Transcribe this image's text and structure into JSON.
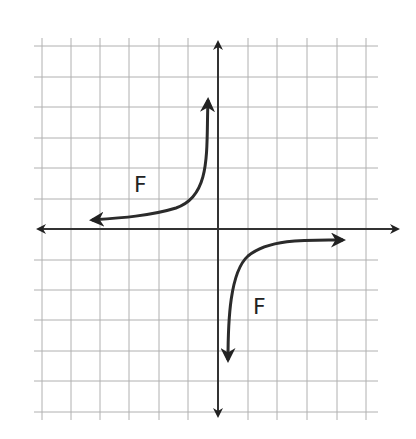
{
  "diagram": {
    "type": "coordinate-grid-graph",
    "grid": {
      "x_lines_px": [
        42,
        71,
        100,
        129,
        159,
        188,
        218,
        248,
        277,
        307,
        337,
        366
      ],
      "y_lines_px": [
        46,
        77,
        107,
        138,
        168,
        199,
        229,
        260,
        290,
        320,
        351,
        381,
        412
      ],
      "color": "#b0b0b0"
    },
    "axes": {
      "x_axis_y": 229,
      "y_axis_x": 218,
      "x_start": 38,
      "x_end": 398,
      "y_start": 42,
      "y_end": 416,
      "color": "#333333"
    },
    "curves": [
      {
        "name": "upper-left-branch",
        "path": "M 208 100 C 206 150, 212 196, 176 208 C 150 216, 120 218, 92 220",
        "color": "#2b2b2b"
      },
      {
        "name": "lower-right-branch",
        "path": "M 343 240 C 310 240, 270 238, 248 256 C 230 272, 228 320, 228 360",
        "color": "#2b2b2b"
      }
    ],
    "labels": [
      {
        "text": "F",
        "x": 134,
        "y": 174
      },
      {
        "text": "F",
        "x": 253,
        "y": 296
      }
    ]
  }
}
